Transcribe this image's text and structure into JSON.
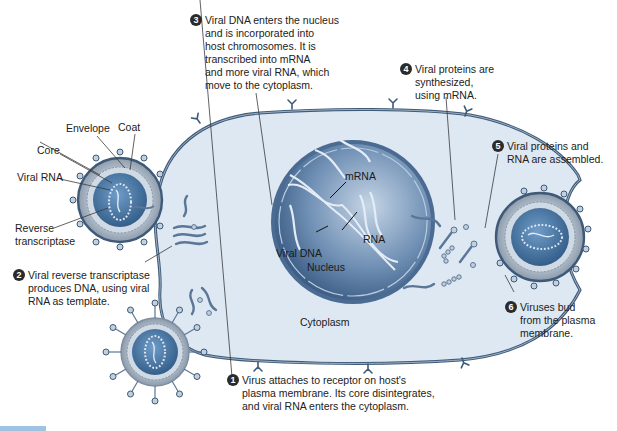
{
  "figure": {
    "colors": {
      "cytoplasm": "#dde8f3",
      "membrane": "#3e5a78",
      "nucleus_dark": "#2e4f78",
      "nucleus_light": "#9fb7d3",
      "virus_core": "#3c6794",
      "text": "#222222",
      "step_badge": "#2b2b2b"
    }
  },
  "virus_labels": {
    "coat": "Coat",
    "envelope": "Envelope",
    "core": "Core",
    "viral_rna": "Viral RNA",
    "reverse_transcriptase_line1": "Reverse",
    "reverse_transcriptase_line2": "transcriptase"
  },
  "inner_labels": {
    "mrna": "mRNA",
    "rna": "RNA",
    "viral_dna": "Viral DNA",
    "nucleus": "Nucleus",
    "cytoplasm": "Cytoplasm"
  },
  "steps": [
    {
      "number": "1",
      "text": "Virus attaches to receptor on host's\nplasma membrane. Its core disintegrates,\nand viral RNA enters the cytoplasm."
    },
    {
      "number": "2",
      "text": "Viral reverse transcriptase\nproduces DNA, using viral\nRNA as template."
    },
    {
      "number": "3",
      "text": "Viral DNA enters the nucleus\nand is incorporated into\nhost chromosomes. It is\ntranscribed into mRNA\nand more viral RNA, which\nmove to the cytoplasm."
    },
    {
      "number": "4",
      "text": "Viral proteins are\nsynthesized,\nusing mRNA."
    },
    {
      "number": "5",
      "text": "Viral proteins and\nRNA are assembled."
    },
    {
      "number": "6",
      "text": "Viruses bud\nfrom the plasma\nmembrane."
    }
  ]
}
